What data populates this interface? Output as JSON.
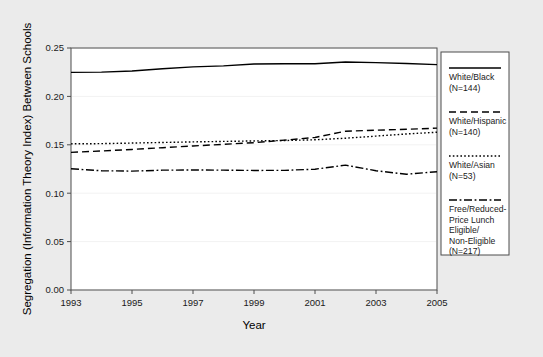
{
  "chart_data": {
    "type": "line",
    "title": "",
    "xlabel": "Year",
    "ylabel": "Segregation (Information Theory Index) Between Schools",
    "xlim": [
      1993,
      2005
    ],
    "ylim": [
      0.0,
      0.25
    ],
    "xticks": [
      1993,
      1995,
      1997,
      1999,
      2001,
      2003,
      2005
    ],
    "xtick_labels": [
      "1993",
      "1995",
      "1997",
      "1999",
      "2001",
      "2003",
      "2005"
    ],
    "yticks": [
      0.0,
      0.05,
      0.1,
      0.15,
      0.2,
      0.25
    ],
    "ytick_labels": [
      "0.00",
      "0.05",
      "0.10",
      "0.15",
      "0.20",
      "0.25"
    ],
    "grid": true,
    "legend_position": "right-outside",
    "x": [
      1993,
      1994,
      1995,
      1996,
      1997,
      1998,
      1999,
      2000,
      2001,
      2002,
      2003,
      2004,
      2005
    ],
    "series": [
      {
        "name": "White/Black",
        "label": "White/Black",
        "n_label": "(N=144)",
        "n": 144,
        "dash": "solid",
        "values": [
          0.2248,
          0.2251,
          0.2263,
          0.2286,
          0.2305,
          0.2315,
          0.2334,
          0.2337,
          0.2337,
          0.2356,
          0.2349,
          0.234,
          0.2328
        ]
      },
      {
        "name": "White/Hispanic",
        "label": "White/Hispanic",
        "n_label": "(N=140)",
        "n": 140,
        "dash": "dashed",
        "values": [
          0.1422,
          0.1436,
          0.1452,
          0.147,
          0.1488,
          0.1505,
          0.1522,
          0.1548,
          0.1576,
          0.164,
          0.1651,
          0.166,
          0.1672
        ]
      },
      {
        "name": "White/Asian",
        "label": "White/Asian",
        "n_label": "(N=53)",
        "n": 53,
        "dash": "dotted",
        "values": [
          0.151,
          0.1512,
          0.1518,
          0.1524,
          0.153,
          0.1535,
          0.154,
          0.1544,
          0.1552,
          0.1568,
          0.159,
          0.1612,
          0.163
        ]
      },
      {
        "name": "Free/Reduced-Price Lunch Eligible/Non-Eligible",
        "label": "Free/Reduced-Price Lunch Eligible/Non-Eligible",
        "label_lines": [
          "Free/Reduced-",
          "Price Lunch",
          "Eligible/",
          "Non-Eligible"
        ],
        "n_label": "(N=217)",
        "n": 217,
        "dash": "dashdot",
        "values": [
          0.1252,
          0.1232,
          0.1228,
          0.1238,
          0.124,
          0.1238,
          0.1235,
          0.1236,
          0.1248,
          0.129,
          0.1232,
          0.1196,
          0.1222
        ]
      }
    ]
  },
  "legend": {
    "entries": [
      {
        "sample": "solid",
        "line1": "White/Black",
        "line2": "(N=144)"
      },
      {
        "sample": "dashed",
        "line1": "White/Hispanic",
        "line2": "(N=140)"
      },
      {
        "sample": "dotted",
        "line1": "White/Asian",
        "line2": "(N=53)"
      },
      {
        "sample": "dashdot",
        "line1": "Free/Reduced-",
        "line2": "Price Lunch",
        "line3": "Eligible/",
        "line4": "Non-Eligible",
        "line5": "(N=217)"
      }
    ]
  },
  "colors": {
    "background": "#ebebeb",
    "plot_area": "#ffffff",
    "line": "#000000",
    "axis": "#4d4d4d",
    "grid": "#f2f2f2"
  }
}
